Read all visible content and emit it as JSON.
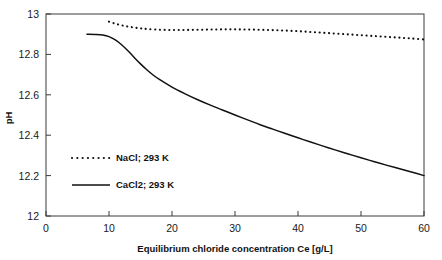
{
  "chart_data": {
    "type": "line",
    "title": "",
    "xlabel": "Equilibrium chloride concentration Ce [g/L]",
    "ylabel": "pH",
    "xlim": [
      0,
      60
    ],
    "ylim": [
      12,
      13
    ],
    "xticks": [
      0,
      10,
      20,
      30,
      40,
      50,
      60
    ],
    "yticks": [
      12,
      12.2,
      12.4,
      12.6,
      12.8,
      13
    ],
    "xtick_labels": [
      "0",
      "10",
      "20",
      "30",
      "40",
      "50",
      "60"
    ],
    "ytick_labels": [
      "12",
      "12.2",
      "12.4",
      "12.6",
      "12.8",
      "13"
    ],
    "grid": false,
    "legend_position": "center-left",
    "series": [
      {
        "name": "NaCl; 293 K",
        "style": "dotted",
        "color": "#111111",
        "x": [
          10,
          11,
          12,
          13,
          14,
          15,
          16,
          18,
          20,
          22,
          24,
          26,
          28,
          30,
          32,
          34,
          36,
          38,
          40,
          42,
          44,
          46,
          48,
          50,
          52,
          54,
          56,
          58,
          60
        ],
        "y": [
          12.962,
          12.952,
          12.944,
          12.938,
          12.933,
          12.929,
          12.926,
          12.922,
          12.921,
          12.921,
          12.922,
          12.923,
          12.924,
          12.924,
          12.923,
          12.922,
          12.92,
          12.918,
          12.915,
          12.911,
          12.907,
          12.903,
          12.899,
          12.895,
          12.891,
          12.887,
          12.883,
          12.879,
          12.874
        ]
      },
      {
        "name": "CaCl2; 293 K",
        "style": "solid",
        "color": "#111111",
        "x": [
          6.5,
          8,
          9,
          10,
          11,
          12,
          13,
          14,
          15,
          16,
          17,
          18,
          20,
          22,
          24,
          26,
          28,
          30,
          32,
          34,
          36,
          38,
          40,
          42,
          44,
          46,
          48,
          50,
          52,
          54,
          56,
          58,
          60
        ],
        "y": [
          12.9,
          12.899,
          12.896,
          12.888,
          12.872,
          12.848,
          12.818,
          12.785,
          12.753,
          12.724,
          12.698,
          12.676,
          12.638,
          12.606,
          12.577,
          12.55,
          12.525,
          12.5,
          12.476,
          12.452,
          12.43,
          12.408,
          12.387,
          12.366,
          12.346,
          12.326,
          12.307,
          12.288,
          12.27,
          12.252,
          12.235,
          12.218,
          12.2
        ]
      }
    ],
    "legend_entries": [
      {
        "label": "NaCl; 293 K",
        "style": "dotted"
      },
      {
        "label": "CaCl2; 293 K",
        "style": "solid"
      }
    ]
  }
}
